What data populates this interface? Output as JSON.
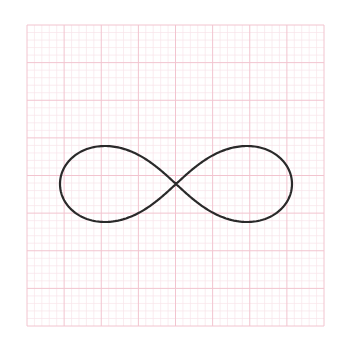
{
  "figure": {
    "grid": {
      "left": 27,
      "top": 25,
      "right": 324,
      "bottom": 326,
      "major_divisions": 8,
      "minor_per_major": 5,
      "major_color": "#f2c4cf",
      "minor_color": "#f8e4ea"
    },
    "curve": {
      "type": "lemniscate",
      "center": [
        176,
        184
      ],
      "half_width": 116,
      "half_height": 38,
      "stroke_color": "#2a2a2a",
      "stroke_width": 2.2
    }
  }
}
